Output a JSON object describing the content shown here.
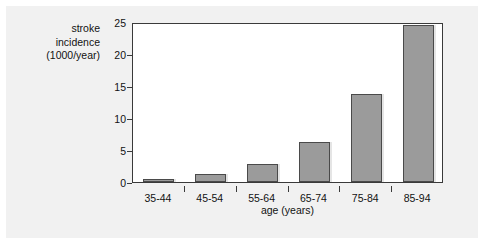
{
  "chart_data": {
    "type": "bar",
    "title": "",
    "subtitle": "",
    "xlabel": "age (years)",
    "ylabel": "stroke incidence (1000/year)",
    "ylabel_lines": [
      "stroke",
      "incidence",
      "(1000/year)"
    ],
    "categories": [
      "35-44",
      "45-54",
      "55-64",
      "65-74",
      "75-84",
      "85-94"
    ],
    "values": [
      0.5,
      1.2,
      2.8,
      6.2,
      13.7,
      24.5
    ],
    "yticks": [
      0,
      5,
      10,
      15,
      20,
      25
    ],
    "ytick_labels": [
      "0",
      "5",
      "10",
      "15",
      "20",
      "25"
    ],
    "ylim": [
      0,
      25
    ],
    "grid": false,
    "legend": false,
    "legend_position": "none",
    "bar_color": "#9b9b9b",
    "bar_edge_color": "#4a4a4a",
    "frame_color": "#3a3a3a",
    "panel_background": "#f1f1f1",
    "plot_background": "#ffffff"
  }
}
